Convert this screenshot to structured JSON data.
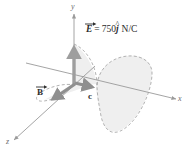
{
  "figure": {
    "background_color": "#ffffff",
    "width": 191,
    "height": 152
  },
  "axes": {
    "y_label": "y",
    "x_label": "x",
    "z_label": "z",
    "axis_color": "#9a9a9a"
  },
  "vectors": {
    "e_field": {
      "symbol": "E",
      "equals": "=",
      "magnitude": "750",
      "unit_vector": "j",
      "hat": "^",
      "units": "N/C",
      "full_label": "E = 750j N/C",
      "color": "#9e9e9e",
      "direction": "+y"
    },
    "b_field": {
      "symbol": "B",
      "color": "#8f8f8f",
      "direction": "-z"
    },
    "propagation": {
      "symbol": "c",
      "color": "#8f8f8f",
      "direction": "+x"
    }
  },
  "wave": {
    "e_wave_color": "#a8a8a8",
    "b_wave_color": "#a8a8a8",
    "fill_color": "#efefef",
    "style": "dashed"
  }
}
